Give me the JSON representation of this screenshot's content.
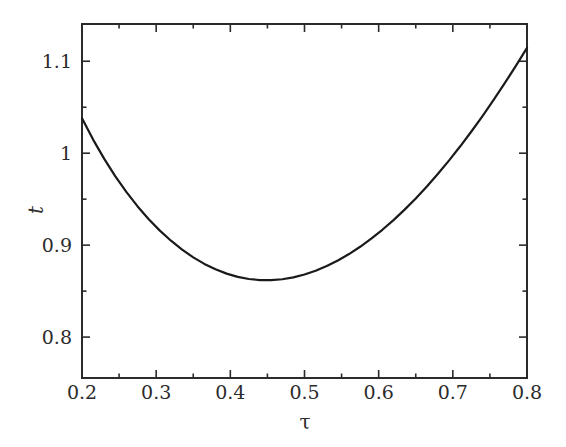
{
  "chart_data": {
    "type": "line",
    "title": "",
    "xlabel": "τ",
    "ylabel": "t",
    "xlim": [
      0.2,
      0.8
    ],
    "ylim": [
      0.7555,
      1.1405
    ],
    "grid": false,
    "legend": null,
    "xticks": [
      0.2,
      0.3,
      0.4,
      0.5,
      0.6,
      0.7,
      0.8
    ],
    "xticklabels": [
      "0.2",
      "0.3",
      "0.4",
      "0.5",
      "0.6",
      "0.7",
      "0.8"
    ],
    "xminorticks": [
      0.25,
      0.35,
      0.45,
      0.55,
      0.65,
      0.75
    ],
    "yticks": [
      0.8,
      0.9,
      1.0,
      1.1
    ],
    "yticklabels": [
      "0.8",
      "0.9",
      "1",
      "1.1"
    ],
    "yminorticks": [
      0.85,
      0.95,
      1.05
    ],
    "line_color": "#1a1a1a",
    "line_width": 2.2,
    "series": [
      {
        "name": "t",
        "x": [
          0.2,
          0.215,
          0.23,
          0.245,
          0.26,
          0.275,
          0.29,
          0.305,
          0.32,
          0.335,
          0.35,
          0.365,
          0.38,
          0.395,
          0.41,
          0.425,
          0.44,
          0.455,
          0.47,
          0.485,
          0.5,
          0.515,
          0.53,
          0.545,
          0.56,
          0.575,
          0.59,
          0.605,
          0.62,
          0.635,
          0.65,
          0.665,
          0.68,
          0.695,
          0.71,
          0.725,
          0.74,
          0.755,
          0.77,
          0.785,
          0.8
        ],
        "y": [
          1.038,
          1.0148,
          0.9938,
          0.9748,
          0.9576,
          0.9421,
          0.9282,
          0.9158,
          0.9048,
          0.8951,
          0.8867,
          0.8796,
          0.8737,
          0.869,
          0.8655,
          0.8632,
          0.862,
          0.8619,
          0.8629,
          0.865,
          0.8681,
          0.8722,
          0.8773,
          0.8833,
          0.8903,
          0.8982,
          0.907,
          0.9167,
          0.9272,
          0.9386,
          0.9508,
          0.9638,
          0.9776,
          0.9922,
          1.0075,
          1.0236,
          1.0404,
          1.0579,
          1.0761,
          1.095,
          1.1146
        ]
      }
    ],
    "annotations": {
      "minimum_point": {
        "x": 0.385,
        "y": 0.845
      },
      "left_endpoint": {
        "x": 0.2,
        "y": 1.038
      },
      "right_endpoint": {
        "x": 0.8,
        "y": 1.066
      }
    },
    "axes_frame": {
      "left_px": 82,
      "right_px": 527,
      "top_px": 24,
      "bottom_px": 378,
      "spine_color": "#2b2b2b",
      "tick_direction": "in"
    }
  }
}
